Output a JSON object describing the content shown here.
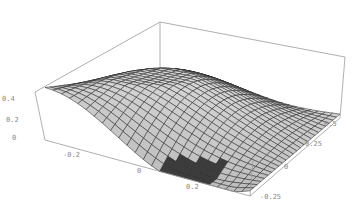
{
  "chart_data": {
    "type": "surface3d",
    "title": "",
    "xlabel": "",
    "ylabel": "",
    "zlabel": "",
    "x_ticks": [
      "-0.2",
      "0",
      "0.2"
    ],
    "y_ticks": [
      "0.5",
      "0.25",
      "0",
      "-0.25"
    ],
    "z_ticks": [
      "0.4",
      "0.2",
      "0"
    ],
    "xlim": [
      -0.35,
      0.35
    ],
    "ylim": [
      -0.35,
      0.6
    ],
    "zlim": [
      0,
      0.5
    ],
    "grid_resolution": [
      25,
      25
    ],
    "surface_description": "Saddle-like wavy mesh surface: high along the left edge (~0.45), ridge peaking near the back-right (~0.5), dipping to ~0 near the front-center; rendered as light-gray shaded quads with dark mesh lines inside a wireframe bounding box",
    "box": true,
    "shading": "gray"
  },
  "axes": {
    "x": {
      "ticks": [
        "-0.2",
        "0",
        "0.2"
      ]
    },
    "y": {
      "ticks": [
        "0.5",
        "0.25",
        "0",
        "-0.25"
      ]
    },
    "z": {
      "ticks": [
        "0.4",
        "0.2",
        "0"
      ]
    }
  }
}
